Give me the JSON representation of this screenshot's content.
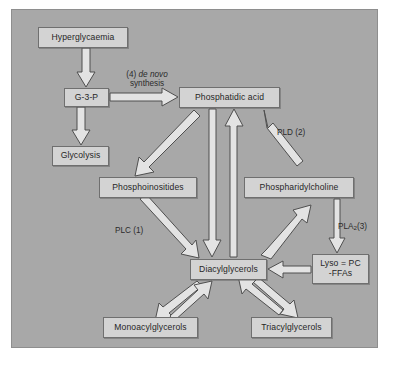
{
  "figure": {
    "panel_bg": "#a8a8a8",
    "node_fill": "#d3d3d3",
    "node_border": "#6f6f6f",
    "arrow_fill": "#e8e8e8",
    "arrow_stroke": "#4a4a4a",
    "text_color": "#262626"
  },
  "nodes": {
    "hyperglycaemia": "Hyperglycaemia",
    "g3p": "G-3-P",
    "glycolysis": "Glycolysis",
    "phosphatidic_acid": "Phosphatidic acid",
    "phosphoinositides": "Phosphoinositides",
    "phosphatidylcholine": "Phospharidylcholine",
    "diacylglycerols": "Diacylglycerols",
    "lyso_line1": "Lyso = PC",
    "lyso_line2": "-FFAs",
    "monoacylglycerols": "Monoacylglycerols",
    "triacylglycerols": "Triacylglycerols"
  },
  "edge_labels": {
    "de_novo_prefix": "(4) ",
    "de_novo_italic": "de novo",
    "de_novo_second_line": "synthesis",
    "pld": "PLD (2)",
    "plc": "PLC (1)",
    "pla2_prefix": "PLA",
    "pla2_sub": "2",
    "pla2_suffix": "(3)"
  },
  "edges": [
    {
      "name": "hyperglycaemia-to-g3p",
      "from": "hyperglycaemia",
      "to": "g3p",
      "direction": "down",
      "style": "hollow-block"
    },
    {
      "name": "g3p-to-glycolysis",
      "from": "g3p",
      "to": "glycolysis",
      "direction": "down",
      "style": "hollow-block"
    },
    {
      "name": "g3p-to-phosphatidic-acid",
      "from": "g3p",
      "to": "phosphatidic_acid",
      "direction": "right",
      "style": "hollow-block",
      "label": "de_novo"
    },
    {
      "name": "phosphatidic-acid-to-phosphoinositides",
      "from": "phosphatidic_acid",
      "to": "phosphoinositides",
      "direction": "down-left",
      "style": "hollow-block"
    },
    {
      "name": "phosphatidic-acid-to-diacylglycerols",
      "from": "phosphatidic_acid",
      "to": "diacylglycerols",
      "direction": "down",
      "style": "hollow-block"
    },
    {
      "name": "diacylglycerols-to-phosphatidic-acid",
      "from": "diacylglycerols",
      "to": "phosphatidic_acid",
      "direction": "up",
      "style": "hollow-block"
    },
    {
      "name": "phosphatidylcholine-to-phosphatidic-acid",
      "from": "phosphatidylcholine",
      "to": "phosphatidic_acid",
      "direction": "up-left",
      "style": "hollow-block",
      "label": "pld"
    },
    {
      "name": "phosphoinositides-to-diacylglycerols",
      "from": "phosphoinositides",
      "to": "diacylglycerols",
      "direction": "down-right",
      "style": "hollow-block",
      "label": "plc"
    },
    {
      "name": "diacylglycerols-to-phosphatidylcholine",
      "from": "diacylglycerols",
      "to": "phosphatidylcholine",
      "direction": "up-right",
      "style": "hollow-block"
    },
    {
      "name": "phosphatidylcholine-to-lyso",
      "from": "phosphatidylcholine",
      "to": "lyso",
      "direction": "down",
      "style": "hollow-block",
      "label": "pla2"
    },
    {
      "name": "lyso-to-diacylglycerols",
      "from": "lyso",
      "to": "diacylglycerols",
      "direction": "left",
      "style": "hollow-block"
    },
    {
      "name": "diacylglycerols-to-monoacylglycerols",
      "from": "diacylglycerols",
      "to": "monoacylglycerols",
      "direction": "down-left",
      "style": "hollow-block"
    },
    {
      "name": "monoacylglycerols-to-diacylglycerols",
      "from": "monoacylglycerols",
      "to": "diacylglycerols",
      "direction": "up-right",
      "style": "hollow-block"
    },
    {
      "name": "diacylglycerols-to-triacylglycerols",
      "from": "diacylglycerols",
      "to": "triacylglycerols",
      "direction": "down-right",
      "style": "hollow-block"
    },
    {
      "name": "triacylglycerols-to-diacylglycerols",
      "from": "triacylglycerols",
      "to": "diacylglycerols",
      "direction": "up-left",
      "style": "hollow-block"
    }
  ]
}
